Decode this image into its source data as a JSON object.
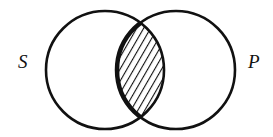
{
  "diagram": {
    "type": "venn",
    "sets": [
      {
        "label": "S",
        "cx": 105,
        "cy": 70,
        "r": 59
      },
      {
        "label": "P",
        "cx": 176,
        "cy": 70,
        "r": 59
      }
    ],
    "shaded_region": "S ∩ P",
    "shading_style": "diagonal-hatch",
    "colors": {
      "stroke": "#111111",
      "background": "#ffffff"
    }
  }
}
